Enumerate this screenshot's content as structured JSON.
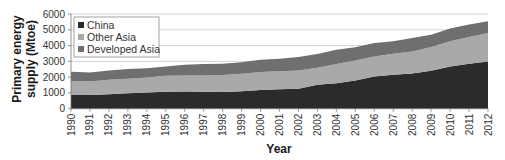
{
  "chart_data": {
    "type": "area",
    "stacked": true,
    "title": "",
    "xlabel": "Year",
    "ylabel": "Primary energy supply (Mtoe)",
    "ylabel_lines": [
      "Primary energy",
      "supply (Mtoe)"
    ],
    "ylim": [
      0,
      6000
    ],
    "yticks": [
      0,
      1000,
      2000,
      3000,
      4000,
      5000,
      6000
    ],
    "grid": true,
    "legend_position": "upper left",
    "categories": [
      "1990",
      "1991",
      "1992",
      "1993",
      "1994",
      "1995",
      "1996",
      "1997",
      "1998",
      "1999",
      "2000",
      "2001",
      "2002",
      "2003",
      "2004",
      "2005",
      "2006",
      "2007",
      "2008",
      "2009",
      "2010",
      "2011",
      "2012"
    ],
    "series": [
      {
        "name": "China",
        "color": "#2b2b2b",
        "values": [
          870,
          870,
          920,
          980,
          1020,
          1080,
          1090,
          1080,
          1060,
          1110,
          1190,
          1240,
          1270,
          1510,
          1620,
          1780,
          2040,
          2150,
          2230,
          2400,
          2680,
          2850,
          2990
        ]
      },
      {
        "name": "Other Asia",
        "color": "#a9a9a9",
        "values": [
          890,
          850,
          910,
          910,
          950,
          1000,
          1020,
          1020,
          1070,
          1100,
          1130,
          1140,
          1150,
          1080,
          1210,
          1280,
          1270,
          1330,
          1400,
          1510,
          1590,
          1700,
          1810
        ]
      },
      {
        "name": "Developed Asia",
        "color": "#6f6f6f",
        "values": [
          580,
          570,
          590,
          620,
          600,
          600,
          670,
          730,
          720,
          740,
          780,
          790,
          850,
          870,
          910,
          830,
          860,
          790,
          850,
          780,
          810,
          780,
          740
        ]
      }
    ]
  },
  "legend": {
    "items": [
      {
        "label": "China",
        "color": "#2b2b2b"
      },
      {
        "label": "Other Asia",
        "color": "#a9a9a9"
      },
      {
        "label": "Developed Asia",
        "color": "#6f6f6f"
      }
    ]
  },
  "axes": {
    "x_title": "Year",
    "y_title_line1": "Primary energy",
    "y_title_line2": "supply (Mtoe)"
  }
}
